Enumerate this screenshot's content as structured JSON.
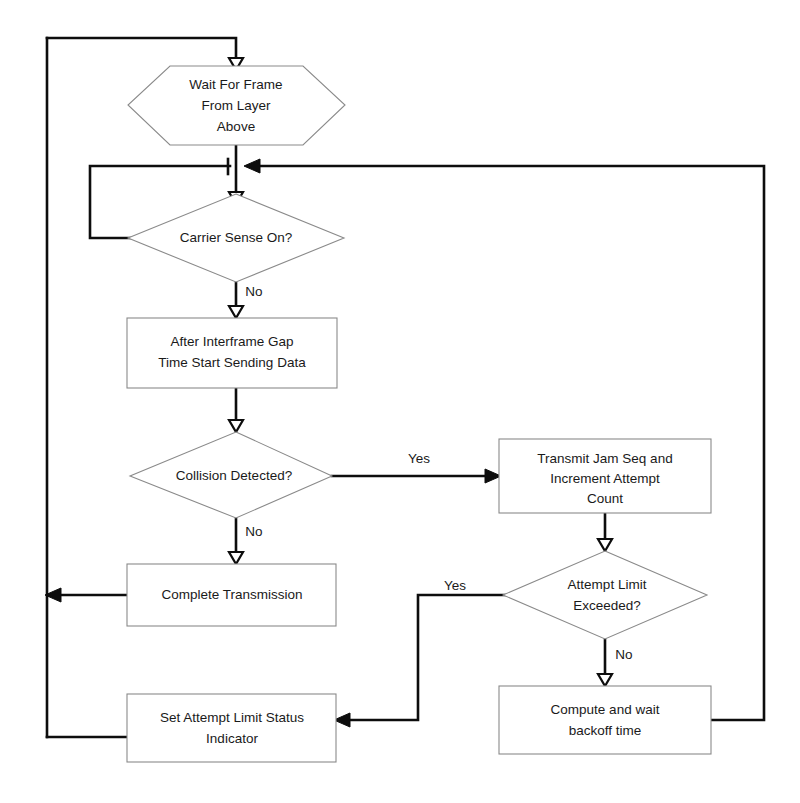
{
  "diagram": {
    "colors": {
      "background": "#ffffff",
      "shape_stroke": "#8a8a8a",
      "connector_stroke": "#0d0d0d",
      "text": "#1a1a1a"
    },
    "nodes": [
      {
        "id": "wait-for-frame",
        "shape": "hexagon",
        "lines": [
          "Wait For Frame",
          "From Layer",
          "Above"
        ]
      },
      {
        "id": "carrier-sense",
        "shape": "diamond",
        "lines": [
          "Carrier Sense On?"
        ]
      },
      {
        "id": "after-interframe-gap",
        "shape": "rectangle",
        "lines": [
          "After Interframe Gap",
          "Time Start Sending Data"
        ]
      },
      {
        "id": "collision-detected",
        "shape": "diamond",
        "lines": [
          "Collision Detected?"
        ]
      },
      {
        "id": "transmit-jam-seq",
        "shape": "rectangle",
        "lines": [
          "Transmit Jam Seq and",
          "Increment Attempt",
          "Count"
        ]
      },
      {
        "id": "attempt-limit-exceeded",
        "shape": "diamond",
        "lines": [
          "Attempt Limit",
          "Exceeded?"
        ]
      },
      {
        "id": "complete-transmission",
        "shape": "rectangle",
        "lines": [
          "Complete Transmission"
        ]
      },
      {
        "id": "compute-backoff",
        "shape": "rectangle",
        "lines": [
          "Compute and wait",
          "backoff time"
        ]
      },
      {
        "id": "set-attempt-limit-status",
        "shape": "rectangle",
        "lines": [
          "Set Attempt Limit Status",
          "Indicator"
        ]
      }
    ],
    "edge_labels": {
      "carrier_sense_no": "No",
      "collision_yes": "Yes",
      "collision_no": "No",
      "attempt_limit_yes": "Yes",
      "attempt_limit_no": "No"
    }
  }
}
